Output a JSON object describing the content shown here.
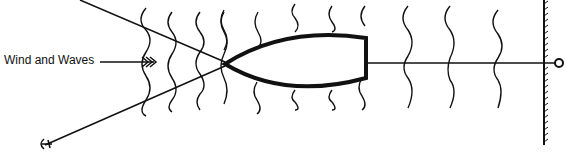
{
  "diagram": {
    "label": "Wind and Waves",
    "elements": [
      "boat",
      "bow anchor line",
      "stern line to shore",
      "anchor",
      "shore wall",
      "ring/bollard",
      "wave lines",
      "wind arrow"
    ]
  }
}
